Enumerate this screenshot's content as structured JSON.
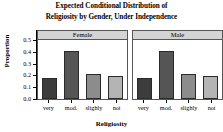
{
  "chart_data": {
    "type": "bar",
    "title": "Expected Conditional Distribution of Religiosity by Gender, Under Independence",
    "title_lines": [
      "Expected Conditional Distribution of",
      "Religiosity by Gender, Under Independence"
    ],
    "xlabel": "Religiosity",
    "ylabel": "Proportion",
    "categories": [
      "very",
      "mod.",
      "slighly",
      "not"
    ],
    "ylim": [
      0.0,
      0.5
    ],
    "yticks": [
      0.0,
      0.1,
      0.2,
      0.3,
      0.4,
      0.5
    ],
    "ytick_labels": [
      "0.0",
      "0.1",
      "0.2",
      "0.3",
      "0.4",
      "0.5"
    ],
    "grid": false,
    "legend": false,
    "panel_variable": "Gender",
    "panels": [
      {
        "label": "Female",
        "values": [
          0.18,
          0.405,
          0.215,
          0.195
        ]
      },
      {
        "label": "Male",
        "values": [
          0.18,
          0.405,
          0.215,
          0.195
        ]
      }
    ],
    "bar_colors": [
      "#3c3c3c",
      "#555555",
      "#8c8c8c",
      "#b4b4b4"
    ],
    "strip_color": "#d4d4d4",
    "border_color": "#555555"
  }
}
